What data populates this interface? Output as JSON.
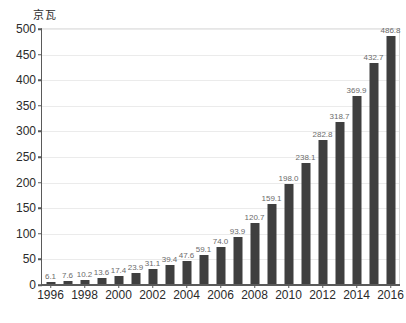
{
  "chart_data": {
    "type": "bar",
    "title": "",
    "subtitle": "",
    "xlabel": "",
    "ylabel": "京瓦",
    "ylim": [
      0,
      500
    ],
    "xlim": [
      1996,
      2016
    ],
    "grid": true,
    "legend": false,
    "legend_position": "none",
    "bar_color": "#3f3f3f",
    "label_color": "#6b6b6b",
    "axis_color": "#5a5a5a",
    "gridline_color": "#ebebeb",
    "background_color": "#ffffff",
    "y_ticks": [
      0,
      50,
      100,
      150,
      200,
      250,
      300,
      350,
      400,
      450,
      500
    ],
    "y_tick_labels": [
      "0",
      "50",
      "100",
      "150",
      "200",
      "250",
      "300",
      "350",
      "400",
      "450",
      "500"
    ],
    "x_tick_labels": [
      "1996",
      "1998",
      "2000",
      "2002",
      "2004",
      "2006",
      "2008",
      "2010",
      "2012",
      "2014",
      "2016"
    ],
    "categories": [
      "1996",
      "1997",
      "1998",
      "1999",
      "2000",
      "2001",
      "2002",
      "2003",
      "2004",
      "2005",
      "2006",
      "2007",
      "2008",
      "2009",
      "2010",
      "2011",
      "2012",
      "2013",
      "2014",
      "2015",
      "2016"
    ],
    "values": [
      6.1,
      7.6,
      10.2,
      13.6,
      17.4,
      23.9,
      31.1,
      39.4,
      47.6,
      59.1,
      74.0,
      93.9,
      120.7,
      159.1,
      198.0,
      238.1,
      282.8,
      318.7,
      369.9,
      432.7,
      486.8
    ],
    "value_labels": [
      "6.1",
      "7.6",
      "10.2",
      "13.6",
      "17.4",
      "23.9",
      "31.1",
      "39.4",
      "47.6",
      "59.1",
      "74.0",
      "93.9",
      "120.7",
      "159.1",
      "198.0",
      "238.1",
      "282.8",
      "318.7",
      "369.9",
      "432.7",
      "486.8"
    ]
  }
}
